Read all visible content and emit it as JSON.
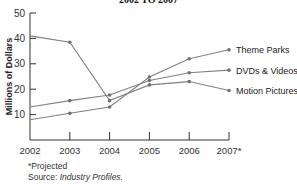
{
  "chart_data": {
    "type": "line",
    "title": "2002 TO 2007",
    "xlabel": "",
    "ylabel": "Millions of Dollars",
    "ylim": [
      0,
      50
    ],
    "yticks": [
      10,
      20,
      30,
      40,
      50
    ],
    "categories": [
      "2002",
      "2003",
      "2004",
      "2005",
      "2006",
      "2007*"
    ],
    "grid": false,
    "legend_position": "inline-right",
    "series": [
      {
        "name": "Theme Parks",
        "values": [
          8,
          10.5,
          13,
          24.8,
          32,
          35.5
        ]
      },
      {
        "name": "DVDs & Videos",
        "values": [
          13,
          15.5,
          17.7,
          23.4,
          26.5,
          27.5
        ]
      },
      {
        "name": "Motion Pictures",
        "values": [
          41,
          38.5,
          15.5,
          21.7,
          23,
          19.5
        ]
      }
    ],
    "line_color": "#808080",
    "marker_color": "#707070"
  },
  "footnote": {
    "projected": "*Projected",
    "source_label": "Source:",
    "source_value": "Industry Profiles."
  }
}
